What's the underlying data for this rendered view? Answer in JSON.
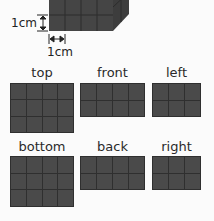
{
  "cube": {
    "unit_height_label": "1cm",
    "unit_width_label": "1cm",
    "fill_color": "#444444"
  },
  "views": [
    {
      "name": "top",
      "label": "top",
      "cols": 4,
      "rows": 3
    },
    {
      "name": "front",
      "label": "front",
      "cols": 4,
      "rows": 2
    },
    {
      "name": "left",
      "label": "left",
      "cols": 3,
      "rows": 2
    },
    {
      "name": "bottom",
      "label": "bottom",
      "cols": 4,
      "rows": 3
    },
    {
      "name": "back",
      "label": "back",
      "cols": 4,
      "rows": 2
    },
    {
      "name": "right",
      "label": "right",
      "cols": 3,
      "rows": 2
    }
  ],
  "colors": {
    "cell_fill": "#4a4a4a",
    "grid_line": "#2f2f2f"
  }
}
